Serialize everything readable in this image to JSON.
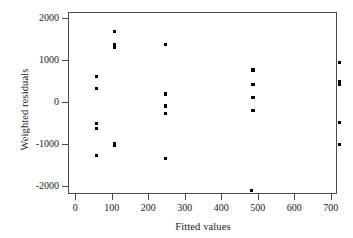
{
  "chart_data": {
    "type": "scatter",
    "title": "",
    "xlabel": "Fitted values",
    "ylabel": "Weighted residuals",
    "xlim": [
      -20,
      717
    ],
    "ylim": [
      -2180,
      2150
    ],
    "grid": false,
    "legend": null,
    "xticks": [
      0,
      100,
      200,
      300,
      400,
      500,
      600,
      700
    ],
    "xtick_labels": [
      "0",
      "100",
      "200",
      "300",
      "400",
      "500",
      "600",
      "700"
    ],
    "yticks": [
      2000,
      1000,
      0,
      -1000,
      -2000
    ],
    "ytick_labels": [
      "2000",
      "1000",
      "0",
      "-1000",
      "-2000"
    ],
    "marker": "square",
    "marker_color": "#000000",
    "points": [
      {
        "x": 58,
        "y": 620
      },
      {
        "x": 58,
        "y": 325
      },
      {
        "x": 58,
        "y": -495
      },
      {
        "x": 58,
        "y": -620
      },
      {
        "x": 58,
        "y": -1255
      },
      {
        "x": 108,
        "y": 1695
      },
      {
        "x": 108,
        "y": 1375
      },
      {
        "x": 108,
        "y": 1300
      },
      {
        "x": 108,
        "y": -975
      },
      {
        "x": 108,
        "y": -1025
      },
      {
        "x": 248,
        "y": 1370
      },
      {
        "x": 248,
        "y": 200
      },
      {
        "x": 248,
        "y": -85
      },
      {
        "x": 248,
        "y": -265
      },
      {
        "x": 248,
        "y": -1340
      },
      {
        "x": 487,
        "y": 770
      },
      {
        "x": 487,
        "y": 430
      },
      {
        "x": 487,
        "y": 125
      },
      {
        "x": 487,
        "y": -190
      },
      {
        "x": 483,
        "y": -2090
      },
      {
        "x": 723,
        "y": 940
      },
      {
        "x": 723,
        "y": 505
      },
      {
        "x": 723,
        "y": 430
      },
      {
        "x": 723,
        "y": -470
      },
      {
        "x": 723,
        "y": -1005
      }
    ]
  }
}
